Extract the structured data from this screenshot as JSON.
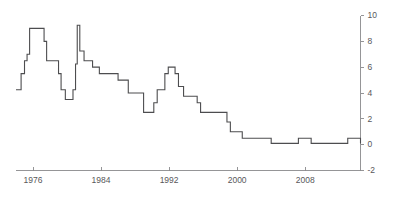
{
  "chart_data": {
    "type": "line",
    "title": "",
    "subtitle": "",
    "xlabel": "",
    "ylabel": "",
    "grid": false,
    "legend": "none",
    "y_axis_position": "right",
    "step_style": "post",
    "line_color": "#4d4d4f",
    "axis_color": "#8a8a8c",
    "label_color": "#58585a",
    "xlim": [
      1974.0,
      2014.5
    ],
    "ylim": [
      -2,
      10
    ],
    "xticks": [
      1976,
      1984,
      1992,
      2000,
      2008
    ],
    "xticklabels": [
      "1976",
      "1984",
      "1992",
      "2000",
      "2008"
    ],
    "yticks": [
      -2,
      0,
      2,
      4,
      6,
      8,
      10
    ],
    "yticklabels": [
      "-2",
      "0",
      "2",
      "4",
      "6",
      "8",
      "10"
    ],
    "series": [
      {
        "name": "Official discount rate",
        "x": [
          1974.0,
          1974.6,
          1975.0,
          1975.3,
          1975.6,
          1975.8,
          1976.0,
          1977.0,
          1977.3,
          1977.6,
          1978.0,
          1978.3,
          1979.0,
          1979.3,
          1979.8,
          1980.0,
          1980.2,
          1980.4,
          1980.7,
          1981.0,
          1981.2,
          1981.5,
          1982.0,
          1983.0,
          1983.8,
          1986.0,
          1986.3,
          1986.7,
          1987.2,
          1989.0,
          1989.4,
          1989.8,
          1990.2,
          1990.6,
          1991.5,
          1991.9,
          1992.3,
          1992.7,
          1993.1,
          1993.7,
          1995.3,
          1995.7,
          1998.8,
          1999.2,
          2000.6,
          2001.1,
          2001.6,
          2004.0,
          2006.5,
          2007.2,
          2008.7,
          2008.9,
          2009.2,
          2013.0,
          2014.5
        ],
        "y": [
          4.25,
          5.5,
          6.5,
          7.0,
          9.0,
          9.0,
          9.0,
          9.0,
          8.0,
          6.5,
          6.5,
          6.5,
          5.5,
          4.25,
          3.5,
          3.5,
          3.5,
          3.5,
          4.25,
          6.25,
          9.25,
          7.25,
          6.5,
          6.0,
          5.5,
          5.0,
          5.0,
          5.0,
          4.0,
          2.5,
          2.5,
          2.5,
          3.25,
          4.25,
          5.5,
          6.0,
          6.0,
          5.5,
          4.5,
          3.75,
          3.25,
          2.5,
          1.75,
          1.0,
          0.5,
          0.5,
          0.5,
          0.1,
          0.1,
          0.5,
          0.1,
          0.1,
          0.1,
          0.5,
          0.1
        ]
      }
    ],
    "annotations": [],
    "notable_points": [
      {
        "label": "peak-1975",
        "x": 1975.6,
        "y": 9.0
      },
      {
        "label": "peak-1981",
        "x": 1981.2,
        "y": 9.25
      },
      {
        "label": "trough-1978",
        "x": 1978.5,
        "y": 3.5
      },
      {
        "label": "peak-1991",
        "x": 1991.9,
        "y": 6.0
      },
      {
        "label": "near-zero-1999",
        "x": 1999.5,
        "y": 0.1
      },
      {
        "label": "bump-2008",
        "x": 2008.0,
        "y": 0.5
      }
    ]
  },
  "axes": {
    "y_axis_name": "right-value-axis",
    "x_axis_name": "bottom-time-axis"
  }
}
